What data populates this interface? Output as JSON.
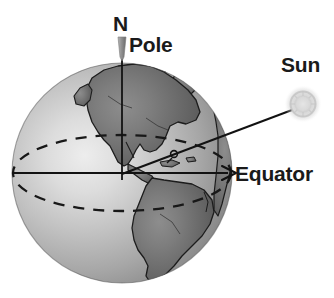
{
  "figure": {
    "type": "astronomy-illustration",
    "background_color": "#ffffff"
  },
  "labels": {
    "north": "N",
    "pole": "Pole",
    "sun": "Sun",
    "equator": "Equator"
  },
  "colors": {
    "ocean_light": "#d8d8d8",
    "ocean_mid": "#b6b6b6",
    "ocean_dark": "#7d7d7d",
    "land": "#6e6e6e",
    "outline": "#1a1a1a",
    "sun_glow": "#c9c9c9",
    "label_text": "#1a1a1a",
    "pole_pin": "#9a9a9a"
  },
  "geometry": {
    "globe_center_x": 122,
    "globe_center_y": 173,
    "globe_radius": 110,
    "axis_top_y": 40,
    "equator_line_y": 173,
    "equator_arrow_x": 234,
    "sun_center_x": 303,
    "sun_center_y": 104,
    "sun_radius": 15,
    "ray_angle_marker_x": 172,
    "ray_angle_marker_y": 155
  },
  "elements": {
    "globe_name": "earth-globe",
    "axis_name": "rotation-axis",
    "equator_name": "equator-line",
    "equatorial_plane_name": "equatorial-plane-ellipse",
    "sun_ray_name": "sun-ray-line",
    "angle_marker_name": "tilt-angle-marker",
    "pole_pin_name": "north-pole-pin"
  }
}
